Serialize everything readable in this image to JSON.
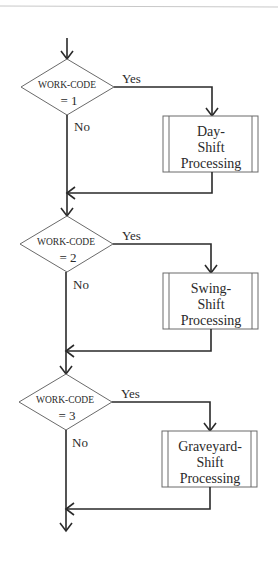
{
  "diagram": {
    "type": "flowchart",
    "decisions": [
      {
        "line1": "WORK-CODE",
        "line2": "= 1",
        "yes_label": "Yes",
        "no_label": "No"
      },
      {
        "line1": "WORK-CODE",
        "line2": "= 2",
        "yes_label": "Yes",
        "no_label": "No"
      },
      {
        "line1": "WORK-CODE",
        "line2": "= 3",
        "yes_label": "Yes",
        "no_label": "No"
      }
    ],
    "processes": [
      {
        "line1": "Day-",
        "line2": "Shift",
        "line3": "Processing"
      },
      {
        "line1": "Swing-",
        "line2": "Shift",
        "line3": "Processing"
      },
      {
        "line1": "Graveyard-",
        "line2": "Shift",
        "line3": "Processing"
      }
    ],
    "colors": {
      "line": "#2a2a2a",
      "shape_border": "#6a6a6a",
      "background": "#ffffff"
    }
  }
}
